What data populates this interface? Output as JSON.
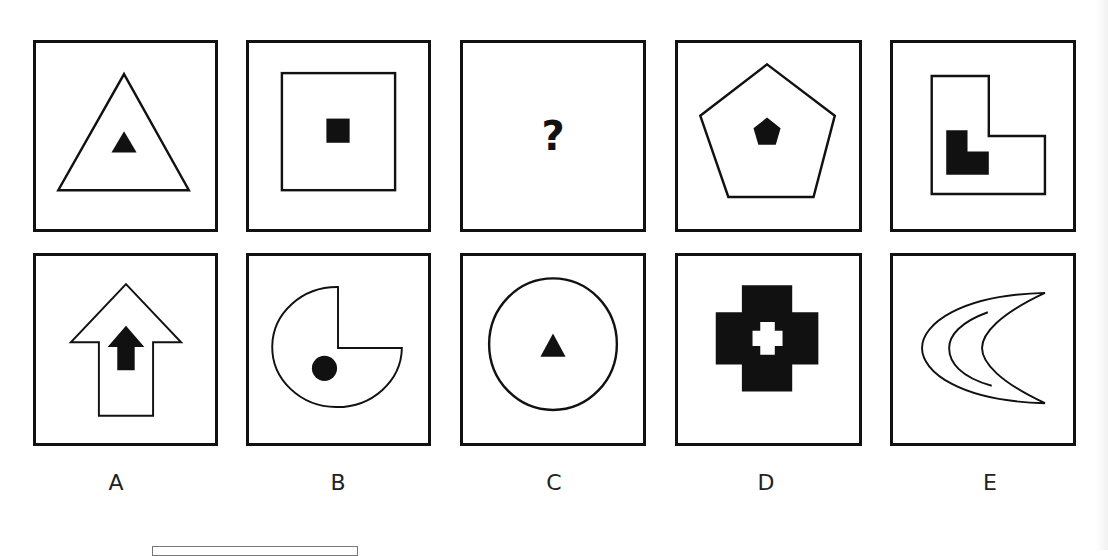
{
  "puzzle": {
    "type": "visual-analogy",
    "top_row": [
      {
        "id": "top-1",
        "outer": "triangle-outline",
        "inner": "small-filled-triangle"
      },
      {
        "id": "top-2",
        "outer": "square-outline",
        "inner": "small-filled-square"
      },
      {
        "id": "top-3",
        "outer": "unknown",
        "inner": "question-mark",
        "text": "?"
      },
      {
        "id": "top-4",
        "outer": "pentagon-outline",
        "inner": "small-filled-pentagon"
      },
      {
        "id": "top-5",
        "outer": "l-shape-outline",
        "inner": "small-filled-l-shape"
      }
    ],
    "options": [
      {
        "label": "A",
        "shape": "arrow-outline-with-filled-arrow"
      },
      {
        "label": "B",
        "shape": "pacman-circle-outline-with-filled-dot"
      },
      {
        "label": "C",
        "shape": "circle-outline-with-filled-triangle"
      },
      {
        "label": "D",
        "shape": "filled-cross-with-white-cross"
      },
      {
        "label": "E",
        "shape": "crescent-outline-with-inner-arc"
      }
    ]
  },
  "labels": [
    "A",
    "B",
    "C",
    "D",
    "E"
  ],
  "colors": {
    "stroke": "#111111",
    "background": "#ffffff"
  }
}
